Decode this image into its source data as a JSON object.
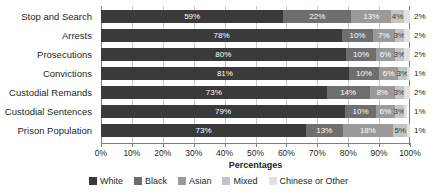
{
  "chart_data": {
    "type": "bar",
    "orientation": "horizontal",
    "stacked": "percent",
    "title": "",
    "xlabel": "Percentages",
    "ylabel": "",
    "xlim": [
      0,
      100
    ],
    "xticks": [
      "0%",
      "10%",
      "20%",
      "30%",
      "40%",
      "50%",
      "60%",
      "70%",
      "80%",
      "90%",
      "100%"
    ],
    "xtick_values": [
      0,
      10,
      20,
      30,
      40,
      50,
      60,
      70,
      80,
      90,
      100
    ],
    "grid": "vertical",
    "legend_position": "bottom",
    "categories": [
      "Stop and Search",
      "Arrests",
      "Prosecutions",
      "Convictions",
      "Custodial Remands",
      "Custodial Sentences",
      "Prison Population"
    ],
    "series": [
      {
        "name": "White",
        "color": "#3a3a3a",
        "values": [
          59,
          78,
          80,
          81,
          73,
          79,
          73
        ]
      },
      {
        "name": "Black",
        "color": "#6e6e6e",
        "values": [
          22,
          10,
          10,
          10,
          14,
          10,
          13
        ]
      },
      {
        "name": "Asian",
        "color": "#9a9a9a",
        "values": [
          13,
          7,
          6,
          6,
          8,
          6,
          18
        ]
      },
      {
        "name": "Mixed",
        "color": "#c4c4c4",
        "values": [
          4,
          3,
          3,
          3,
          3,
          3,
          5
        ]
      },
      {
        "name": "Chinese or Other",
        "color": "#e2e2e2",
        "values": [
          2,
          2,
          2,
          1,
          2,
          1,
          1
        ]
      }
    ],
    "data_labels": [
      [
        "59%",
        "22%",
        "13%",
        "4%",
        "2%"
      ],
      [
        "78%",
        "10%",
        "7%",
        "3%",
        "2%"
      ],
      [
        "80%",
        "10%",
        "6%",
        "3%",
        "2%"
      ],
      [
        "81%",
        "10%",
        "6%",
        "3%",
        "1%"
      ],
      [
        "73%",
        "14%",
        "8%",
        "3%",
        "2%"
      ],
      [
        "79%",
        "10%",
        "6%",
        "3%",
        "1%"
      ],
      [
        "73%",
        "13%",
        "18%",
        "5%",
        "1%"
      ]
    ]
  },
  "legend": {
    "items": [
      {
        "label": "White"
      },
      {
        "label": "Black"
      },
      {
        "label": "Asian"
      },
      {
        "label": "Mixed"
      },
      {
        "label": "Chinese or Other"
      }
    ]
  }
}
